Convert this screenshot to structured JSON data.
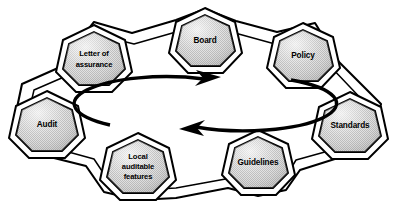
{
  "diagram": {
    "type": "cycle-ring",
    "colors": {
      "node_fill": "#d2d2d2",
      "node_fill_highlight": "#eeeeee",
      "outline": "#000000",
      "background": "#ffffff",
      "band_fill": "#ffffff"
    },
    "center_arrows": {
      "name": "bidirectional-cycle-arrows",
      "top_arrow_direction": "right",
      "bottom_arrow_direction": "left",
      "shape": "ellipse"
    },
    "nodes": [
      {
        "id": "board",
        "label": "Board",
        "lines": [
          "Board"
        ],
        "cx": 205,
        "cy": 40,
        "r": 27
      },
      {
        "id": "policy",
        "label": "Policy",
        "lines": [
          "Policy"
        ],
        "cx": 303,
        "cy": 55,
        "r": 27
      },
      {
        "id": "standards",
        "label": "Standards",
        "lines": [
          "Standards"
        ],
        "cx": 350,
        "cy": 125,
        "r": 28
      },
      {
        "id": "guidelines",
        "label": "Guidelines",
        "lines": [
          "Guidelines"
        ],
        "cx": 258,
        "cy": 162,
        "r": 27
      },
      {
        "id": "local-auditable-features",
        "label": "Local auditable features",
        "lines": [
          "Local",
          "auditable",
          "features"
        ],
        "cx": 138,
        "cy": 166,
        "r": 28
      },
      {
        "id": "audit",
        "label": "Audit",
        "lines": [
          "Audit"
        ],
        "cx": 47,
        "cy": 124,
        "r": 28
      },
      {
        "id": "letter-of-assurance",
        "label": "Letter of assurance",
        "lines": [
          "Letter of",
          "assurance"
        ],
        "cx": 94,
        "cy": 58,
        "r": 28
      }
    ],
    "connections": [
      {
        "from": "board",
        "to": "policy"
      },
      {
        "from": "policy",
        "to": "standards"
      },
      {
        "from": "standards",
        "to": "guidelines"
      },
      {
        "from": "guidelines",
        "to": "local-auditable-features"
      },
      {
        "from": "local-auditable-features",
        "to": "audit"
      },
      {
        "from": "audit",
        "to": "letter-of-assurance"
      },
      {
        "from": "letter-of-assurance",
        "to": "board"
      }
    ]
  }
}
